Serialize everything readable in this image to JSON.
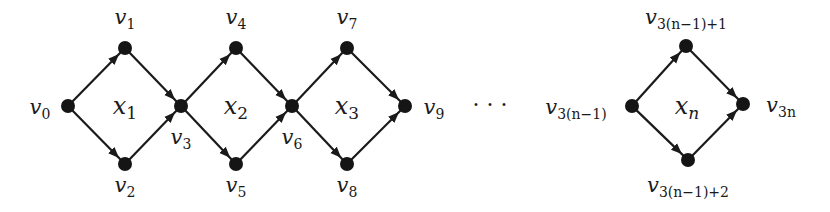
{
  "diagram": {
    "nodes": [
      {
        "id": "v0",
        "base": "v",
        "sub": "0",
        "x": 68,
        "y": 106,
        "label_x": 40,
        "label_y": 114,
        "label_anchor": "middle"
      },
      {
        "id": "v1",
        "base": "v",
        "sub": "1",
        "x": 125,
        "y": 48,
        "label_x": 125,
        "label_y": 24,
        "label_anchor": "middle"
      },
      {
        "id": "v2",
        "base": "v",
        "sub": "2",
        "x": 125,
        "y": 164,
        "label_x": 125,
        "label_y": 192,
        "label_anchor": "middle"
      },
      {
        "id": "v3",
        "base": "v",
        "sub": "3",
        "x": 181,
        "y": 106,
        "label_x": 181,
        "label_y": 144,
        "label_anchor": "middle"
      },
      {
        "id": "v4",
        "base": "v",
        "sub": "4",
        "x": 236,
        "y": 48,
        "label_x": 236,
        "label_y": 24,
        "label_anchor": "middle"
      },
      {
        "id": "v5",
        "base": "v",
        "sub": "5",
        "x": 236,
        "y": 164,
        "label_x": 236,
        "label_y": 192,
        "label_anchor": "middle"
      },
      {
        "id": "v6",
        "base": "v",
        "sub": "6",
        "x": 292,
        "y": 106,
        "label_x": 292,
        "label_y": 144,
        "label_anchor": "middle"
      },
      {
        "id": "v7",
        "base": "v",
        "sub": "7",
        "x": 347,
        "y": 48,
        "label_x": 347,
        "label_y": 24,
        "label_anchor": "middle"
      },
      {
        "id": "v8",
        "base": "v",
        "sub": "8",
        "x": 347,
        "y": 164,
        "label_x": 347,
        "label_y": 192,
        "label_anchor": "middle"
      },
      {
        "id": "v9",
        "base": "v",
        "sub": "9",
        "x": 405,
        "y": 106,
        "label_x": 434,
        "label_y": 114,
        "label_anchor": "middle"
      },
      {
        "id": "v3n1",
        "base": "v",
        "sub": "3(n−1)",
        "x": 632,
        "y": 106,
        "label_x": 576,
        "label_y": 114,
        "label_anchor": "middle"
      },
      {
        "id": "v3n1p1",
        "base": "v",
        "sub": "3(n−1)+1",
        "x": 686,
        "y": 46,
        "label_x": 686,
        "label_y": 24,
        "label_anchor": "middle"
      },
      {
        "id": "v3n1p2",
        "base": "v",
        "sub": "3(n−1)+2",
        "x": 688,
        "y": 160,
        "label_x": 688,
        "label_y": 192,
        "label_anchor": "middle"
      },
      {
        "id": "v3n",
        "base": "v",
        "sub": "3n",
        "x": 743,
        "y": 104,
        "label_x": 781,
        "label_y": 112,
        "label_anchor": "middle"
      }
    ],
    "edges": [
      [
        "v0",
        "v1"
      ],
      [
        "v0",
        "v2"
      ],
      [
        "v1",
        "v3"
      ],
      [
        "v2",
        "v3"
      ],
      [
        "v3",
        "v4"
      ],
      [
        "v3",
        "v5"
      ],
      [
        "v4",
        "v6"
      ],
      [
        "v5",
        "v6"
      ],
      [
        "v6",
        "v7"
      ],
      [
        "v6",
        "v8"
      ],
      [
        "v7",
        "v9"
      ],
      [
        "v8",
        "v9"
      ],
      [
        "v3n1",
        "v3n1p1"
      ],
      [
        "v3n1",
        "v3n1p2"
      ],
      [
        "v3n1p1",
        "v3n"
      ],
      [
        "v3n1p2",
        "v3n"
      ]
    ],
    "gadgets": [
      {
        "id": "x1",
        "base": "x",
        "sub": "1",
        "x": 125,
        "y": 114
      },
      {
        "id": "x2",
        "base": "x",
        "sub": "2",
        "x": 236,
        "y": 114
      },
      {
        "id": "x3",
        "base": "x",
        "sub": "3",
        "x": 347,
        "y": 114
      },
      {
        "id": "xn",
        "base": "x",
        "sub": "n",
        "x": 687,
        "y": 114
      }
    ],
    "ellipsis": {
      "text": "· · ·",
      "x": 490,
      "y": 112
    },
    "colors": {
      "node": "#151515",
      "edge": "#1a1a1a",
      "background": "#ffffff"
    }
  }
}
